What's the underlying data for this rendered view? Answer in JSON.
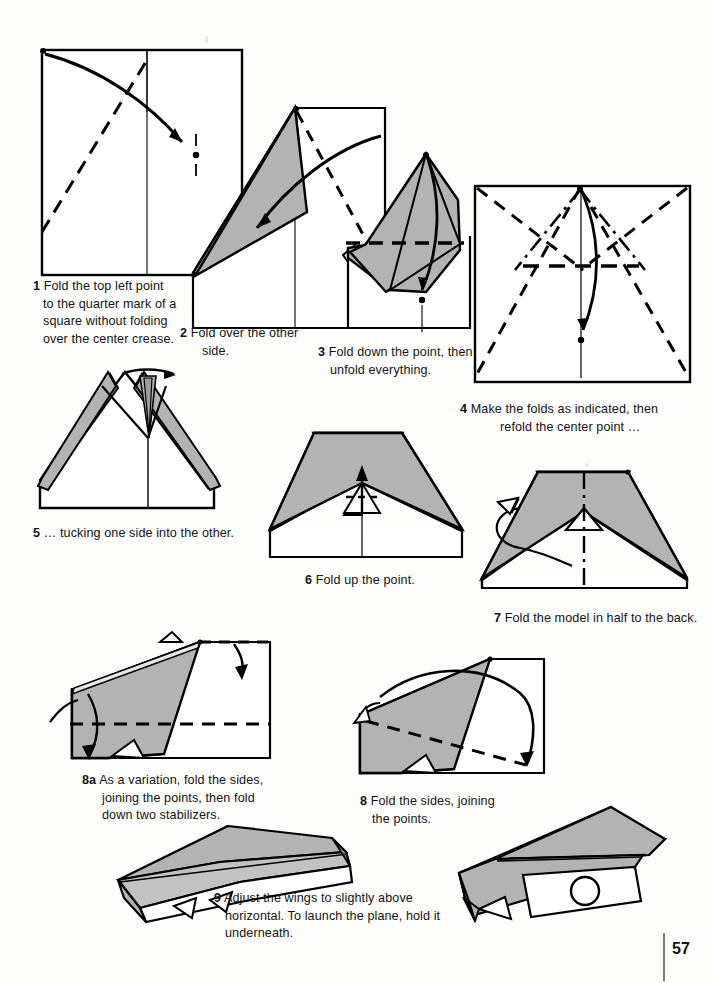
{
  "document": {
    "title": "Paper Airplane Folding Instructions",
    "page_number": "57",
    "colors": {
      "paper_fill": "#b3b3b3",
      "paper_fill_light": "#c9c9c9",
      "stroke": "#000000",
      "background": "#ffffff",
      "text": "#141414"
    }
  },
  "steps": [
    {
      "id": "step-1",
      "number": "1",
      "text": "Fold the top left point to the quarter mark of a square without folding over the center crease.",
      "lines": [
        "Fold the top left point",
        "to the quarter mark of a",
        "square without folding",
        "over the center crease."
      ]
    },
    {
      "id": "step-2",
      "number": "2",
      "text": "Fold over the other side.",
      "lines": [
        "Fold over the other",
        "side."
      ]
    },
    {
      "id": "step-3",
      "number": "3",
      "text": "Fold down the point, then unfold everything.",
      "lines": [
        "Fold down the point, then",
        "unfold everything."
      ]
    },
    {
      "id": "step-4",
      "number": "4",
      "text": "Make the folds as indicated, then refold the center point …",
      "lines": [
        "Make the folds as indicated, then",
        "refold the center point …"
      ]
    },
    {
      "id": "step-5",
      "number": "5",
      "text": "… tucking one side into the other.",
      "lines": [
        "… tucking one side into the other."
      ]
    },
    {
      "id": "step-6",
      "number": "6",
      "text": "Fold up the point.",
      "lines": [
        "Fold up the point."
      ]
    },
    {
      "id": "step-7",
      "number": "7",
      "text": "Fold the model in half to the back.",
      "lines": [
        "Fold the model in half to the back."
      ]
    },
    {
      "id": "step-8a",
      "number": "8a",
      "text": "As a variation, fold the sides, joining the points, then fold down two stabilizers.",
      "lines": [
        "As a variation, fold the sides,",
        "joining the points, then fold",
        "down two stabilizers."
      ]
    },
    {
      "id": "step-8",
      "number": "8",
      "text": "Fold the sides, joining the points.",
      "lines": [
        "Fold the sides, joining",
        "the points."
      ]
    },
    {
      "id": "step-9",
      "number": "9",
      "text": "Adjust the wings to slightly above horizontal. To launch the plane, hold it underneath.",
      "lines": [
        "Adjust the wings to slightly above",
        "horizontal. To launch the plane, hold it",
        "underneath."
      ]
    }
  ],
  "diagram_labels": {
    "d1": "square-with-diagonal-fold",
    "d2": "first-flap-folded",
    "d3": "point-folded-down",
    "d4": "crease-pattern-unfolded",
    "d5": "tuck-one-side",
    "d6": "fold-up-point",
    "d7": "fold-in-half-back",
    "d8a": "variation-fold-sides",
    "d8": "fold-sides-joining-points",
    "d9a": "finished-plane-variation",
    "d9b": "finished-plane-launch"
  }
}
